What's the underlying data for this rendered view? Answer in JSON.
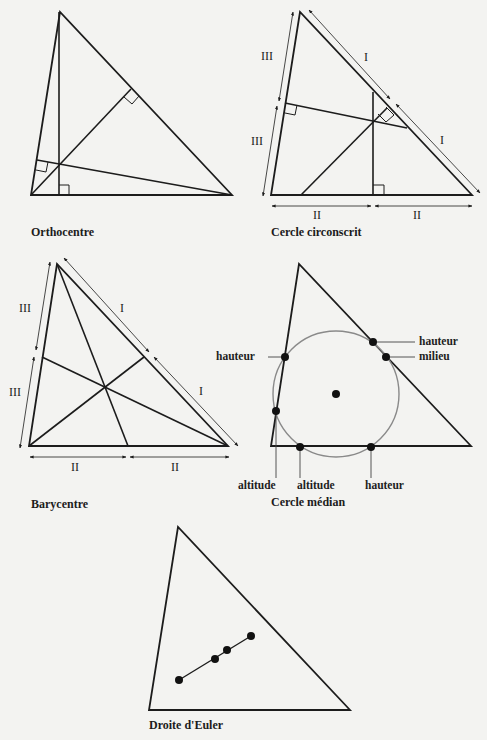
{
  "colors": {
    "background": "#f3f3f1",
    "stroke": "#1c1c1c",
    "circle": "#8a8a8a",
    "text": "#1c1c1c"
  },
  "panels": [
    {
      "id": "orthocentre",
      "caption": "Orthocentre",
      "vertices": [
        [
          60,
          12
        ],
        [
          31,
          195
        ],
        [
          232,
          195
        ]
      ],
      "concurrency_point": [
        59,
        164
      ],
      "description": "Three altitudes meeting at the orthocentre, with right-angle marks at their feet"
    },
    {
      "id": "cercle-circonscrit",
      "caption": "Cercle circonscrit",
      "vertices": [
        [
          300,
          12
        ],
        [
          271,
          195
        ],
        [
          472,
          195
        ]
      ],
      "concurrency_point": [
        373,
        122
      ],
      "segment_marks": {
        "side_AC": "I",
        "side_BC": "II",
        "side_AB": "III"
      },
      "description": "Perpendicular bisectors meeting at the circumcentre"
    },
    {
      "id": "barycentre",
      "caption": "Barycentre",
      "vertices": [
        [
          57,
          264
        ],
        [
          29,
          446
        ],
        [
          228,
          446
        ]
      ],
      "concurrency_point": [
        105,
        369
      ],
      "segment_marks": {
        "side_AC": "I",
        "side_BC": "II",
        "side_AB": "III"
      },
      "description": "Medians meeting at the centroid"
    },
    {
      "id": "cercle-median",
      "caption": "Cercle médian",
      "vertices": [
        [
          299,
          264
        ],
        [
          271,
          446
        ],
        [
          471,
          446
        ]
      ],
      "circle": {
        "center": [
          336,
          394
        ],
        "radius": 63
      },
      "point_labels": {
        "hauteur_right_top": "hauteur",
        "milieu_right": "milieu",
        "hauteur_left": "hauteur",
        "altitude_1": "altitude",
        "altitude_2": "altitude",
        "hauteur_bottom": "hauteur"
      },
      "description": "Nine-point circle passing through feet of altitudes and midpoints"
    },
    {
      "id": "droite-euler",
      "caption": "Droite d'Euler",
      "vertices": [
        [
          178,
          527
        ],
        [
          149,
          710
        ],
        [
          350,
          710
        ]
      ],
      "euler_points": [
        [
          179,
          680
        ],
        [
          215,
          659
        ],
        [
          227,
          650
        ],
        [
          251,
          636
        ]
      ],
      "description": "Euler line through orthocentre, centroid, nine-point centre and circumcentre"
    }
  ],
  "roman_marks": {
    "one": "I",
    "two": "II",
    "three": "III"
  }
}
